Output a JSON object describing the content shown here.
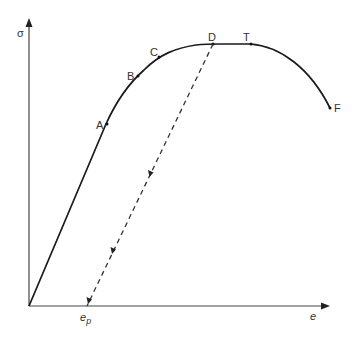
{
  "diagram": {
    "y_axis_label": "σ",
    "x_axis_label": "e",
    "plastic_strain_label": "e",
    "plastic_strain_subscript": "p",
    "points": {
      "A": "A",
      "B": "B",
      "C": "C",
      "D": "D",
      "T": "T",
      "F": "F"
    },
    "colors": {
      "curve": "#1a1a1a",
      "axes": "#333333",
      "dashed": "#333333",
      "text": "#333333"
    }
  }
}
